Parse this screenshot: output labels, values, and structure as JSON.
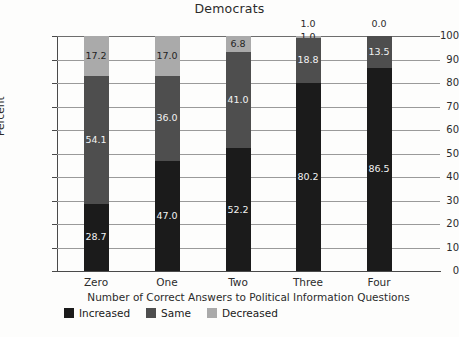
{
  "chart_data": {
    "type": "bar",
    "subtype": "stacked-bar-vertical",
    "title": "Democrats",
    "xlabel": "Number of Correct Answers to Political Information Questions",
    "ylabel": "Percent",
    "categories": [
      "Zero",
      "One",
      "Two",
      "Three",
      "Four"
    ],
    "ylim": [
      0,
      100
    ],
    "yticks": [
      0,
      10,
      20,
      30,
      40,
      50,
      60,
      70,
      80,
      90,
      100
    ],
    "ytick_labels": [
      "0",
      "10",
      "20",
      "30",
      "40",
      "50",
      "60",
      "70",
      "80",
      "90",
      "100"
    ],
    "grid": true,
    "grid_axis": "y",
    "legend_position": "bottom-left",
    "stack_order_bottom_to_top": [
      "Increased",
      "Same",
      "Decreased"
    ],
    "series": [
      {
        "name": "Increased",
        "color": "#1b1b1b",
        "values": [
          28.7,
          47.0,
          52.2,
          80.2,
          86.5
        ],
        "labels": [
          "28.7",
          "47.0",
          "52.2",
          "80.2",
          "86.5"
        ]
      },
      {
        "name": "Same",
        "color": "#4e4e4e",
        "values": [
          54.1,
          36.0,
          41.0,
          18.8,
          13.5
        ],
        "labels": [
          "54.1",
          "36.0",
          "41.0",
          "18.8",
          "13.5"
        ]
      },
      {
        "name": "Decreased",
        "color": "#aaaaaa",
        "values": [
          17.2,
          17.0,
          6.8,
          1.0,
          0.0
        ],
        "labels": [
          "17.2",
          "17.0",
          "6.8",
          "1.0",
          "0.0"
        ]
      }
    ],
    "annotations": [
      {
        "text": "1.0",
        "category": "Three",
        "placement": "above-bar"
      },
      {
        "text": "0.0",
        "category": "Four",
        "placement": "above-bar"
      }
    ]
  },
  "legend": {
    "items": [
      {
        "label": "Increased",
        "color": "#1b1b1b"
      },
      {
        "label": "Same",
        "color": "#4e4e4e"
      },
      {
        "label": "Decreased",
        "color": "#aaaaaa"
      }
    ]
  }
}
